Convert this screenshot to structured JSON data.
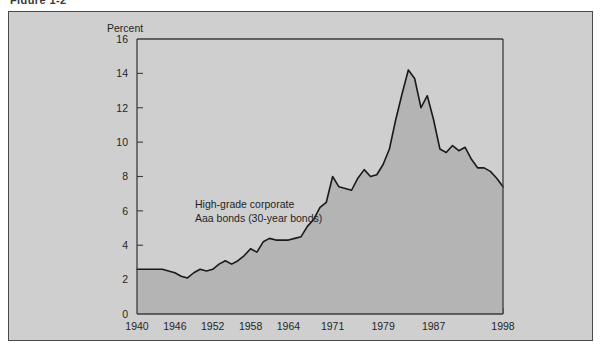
{
  "figure": {
    "clipped_caption": "Figure 1-2",
    "panel_background": "#cfcfcf",
    "panel_border_color": "#4a4a4a"
  },
  "chart_data": {
    "type": "area",
    "title": "",
    "subtitle": "",
    "xlabel": "",
    "ylabel": "Percent",
    "ylim": [
      0,
      16
    ],
    "xlim": [
      1940,
      1998
    ],
    "grid": false,
    "legend_position": "none",
    "series_color": "#1a1a1a",
    "fill_color": "#b4b4b4",
    "ytick_labels": [
      "0",
      "2",
      "4",
      "6",
      "8",
      "10",
      "12",
      "14",
      "16"
    ],
    "ytick_values": [
      0,
      2,
      4,
      6,
      8,
      10,
      12,
      14,
      16
    ],
    "xtick_labels": [
      "1940",
      "1946",
      "1952",
      "1958",
      "1964",
      "1971",
      "1979",
      "1987",
      "1998"
    ],
    "xtick_values": [
      1940,
      1946,
      1952,
      1958,
      1964,
      1971,
      1979,
      1987,
      1998
    ],
    "annotations": [
      {
        "line1": "High-grade corporate",
        "line2": "Aaa bonds (30-year bonds)",
        "x": 1951,
        "y": 7.0
      }
    ],
    "series": [
      {
        "name": "High-grade corporate Aaa bonds (30-year bonds)",
        "x": [
          1940,
          1941,
          1942,
          1943,
          1944,
          1945,
          1946,
          1947,
          1948,
          1949,
          1950,
          1951,
          1952,
          1953,
          1954,
          1955,
          1956,
          1957,
          1958,
          1959,
          1960,
          1961,
          1962,
          1963,
          1964,
          1965,
          1966,
          1967,
          1968,
          1969,
          1970,
          1971,
          1972,
          1973,
          1974,
          1975,
          1976,
          1977,
          1978,
          1979,
          1980,
          1981,
          1982,
          1983,
          1984,
          1985,
          1986,
          1987,
          1988,
          1989,
          1990,
          1991,
          1992,
          1993,
          1994,
          1995,
          1996,
          1997,
          1998
        ],
        "values": [
          2.6,
          2.6,
          2.6,
          2.6,
          2.6,
          2.5,
          2.4,
          2.2,
          2.1,
          2.4,
          2.6,
          2.5,
          2.6,
          2.9,
          3.1,
          2.9,
          3.1,
          3.4,
          3.8,
          3.6,
          4.2,
          4.4,
          4.3,
          4.3,
          4.3,
          4.4,
          4.5,
          5.1,
          5.5,
          6.2,
          6.5,
          8.0,
          7.4,
          7.3,
          7.2,
          7.9,
          8.4,
          8.0,
          8.1,
          8.7,
          9.6,
          11.3,
          12.8,
          14.2,
          13.7,
          12.0,
          12.7,
          11.3,
          9.6,
          9.4,
          9.8,
          9.5,
          9.7,
          9.0,
          8.5,
          8.5,
          8.3,
          7.9,
          7.4
        ]
      }
    ]
  }
}
